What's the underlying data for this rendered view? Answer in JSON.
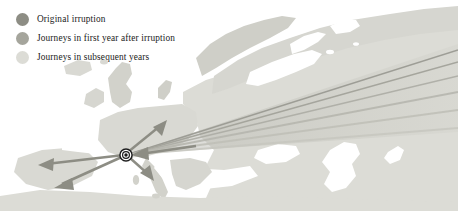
{
  "figure": {
    "type": "thematic-map",
    "width": 458,
    "height": 211,
    "background_color": "#ffffff",
    "region_description": "Europe, North Atlantic and western Asia"
  },
  "legend": {
    "items": [
      {
        "label": "Original irruption",
        "color": "#8d8d84",
        "swatch_icon": "filled-circle-icon"
      },
      {
        "label": "Journeys in first year after irruption",
        "color": "#a5a59c",
        "swatch_icon": "filled-circle-icon"
      },
      {
        "label": "Journeys in subsequent years",
        "color": "#dcdcd6",
        "swatch_icon": "filled-circle-icon"
      }
    ]
  },
  "map": {
    "ocean_color": "#ffffff",
    "land_color": "#dcdcd6",
    "land_color_light": "#e6e6e1",
    "origin_marker": {
      "name": "origin-point",
      "x": 126,
      "y": 155,
      "ring_color": "#1d1d1d",
      "core_color": "#1d1d1d"
    },
    "arrow_colors": {
      "original": "#8d8d84",
      "first_year": "#a5a59c",
      "subsequent": "#c9c9c2"
    },
    "flows": [
      {
        "group": "original",
        "label": "southwest to Iberia (north)",
        "x2": 40,
        "y2": 165
      },
      {
        "group": "original",
        "label": "southwest to Iberia (south)",
        "x2": 56,
        "y2": 186
      },
      {
        "group": "original",
        "label": "north to Denmark",
        "x2": 161,
        "y2": 118
      },
      {
        "group": "original",
        "label": "south to Italy",
        "x2": 148,
        "y2": 180
      },
      {
        "group": "first_year",
        "label": "east northeast fan ray 1",
        "x2": 440,
        "y2": 52
      },
      {
        "group": "first_year",
        "label": "east northeast fan ray 2",
        "x2": 440,
        "y2": 70
      },
      {
        "group": "subsequent",
        "label": "east fan ray 3",
        "x2": 440,
        "y2": 88
      },
      {
        "group": "subsequent",
        "label": "east fan ray 4",
        "x2": 440,
        "y2": 104
      },
      {
        "group": "subsequent",
        "label": "east fan ray 5",
        "x2": 440,
        "y2": 120
      }
    ]
  }
}
